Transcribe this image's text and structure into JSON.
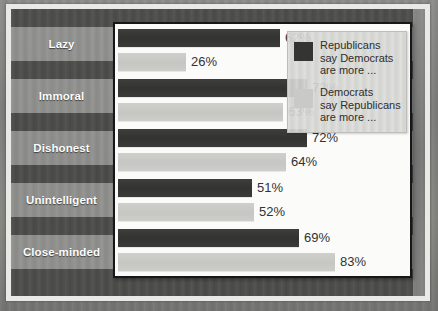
{
  "chart_data": {
    "type": "bar",
    "orientation": "horizontal",
    "title": "",
    "subtitle": "",
    "xlabel": "",
    "ylabel": "",
    "xlim": [
      0,
      100
    ],
    "grid": false,
    "legend_position": "top-right",
    "value_suffix": "%",
    "categories": [
      "Lazy",
      "Immoral",
      "Dishonest",
      "Unintelligent",
      "Close-minded"
    ],
    "series": [
      {
        "name": "Republicans say Democrats are more ...",
        "color": "#343433",
        "values": [
          62,
          72,
          72,
          51,
          69
        ],
        "labels": [
          "62%",
          "72%",
          "72%",
          "51%",
          "69%"
        ]
      },
      {
        "name": "Democrats say Republicans are more ...",
        "color": "#c9c9c6",
        "values": [
          26,
          63,
          64,
          52,
          83
        ],
        "labels": [
          "26%",
          "63%",
          "64%",
          "52%",
          "83%"
        ]
      }
    ]
  },
  "legend": {
    "entries": [
      {
        "swatch": "#343433",
        "lines": [
          "Republicans",
          "say Democrats",
          "are more ..."
        ]
      },
      {
        "swatch": "#c9c9c6",
        "lines": [
          "Democrats",
          "say Republicans",
          "are more ..."
        ]
      }
    ]
  },
  "labels": {
    "items": [
      {
        "text": "Lazy"
      },
      {
        "text": "Immoral"
      },
      {
        "text": "Dishonest"
      },
      {
        "text": "Unintelligent"
      },
      {
        "text": "Close-minded"
      }
    ]
  },
  "colors": {
    "bar_dark": "#343433",
    "bar_light": "#c9c9c6",
    "panel_background": "#fbfbfa",
    "panel_border": "#16171a",
    "band_dark": "#464644",
    "band_light": "#969693",
    "page_background": "#7a7a79",
    "mat": "#e9e9e6",
    "value_text": "#323232",
    "label_text": "#fdfdfd"
  }
}
